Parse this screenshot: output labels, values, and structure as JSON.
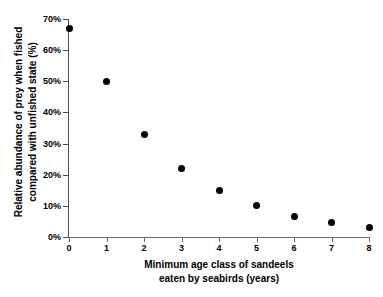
{
  "clipped_header_text": "",
  "chart_data": {
    "type": "scatter",
    "title": "",
    "xlabel_lines": [
      "Minimum age class of sandeels",
      "eaten by seabirds (years)"
    ],
    "ylabel_lines": [
      "Relative abundance of prey when fished",
      "compared with unfished state (%)"
    ],
    "x": [
      0,
      1,
      2,
      3,
      4,
      5,
      6,
      7,
      8
    ],
    "values": [
      67,
      50,
      33,
      22,
      15,
      10,
      6.5,
      4.5,
      3
    ],
    "x_tick_labels": [
      "0",
      "1",
      "2",
      "3",
      "4",
      "5",
      "6",
      "7",
      "8"
    ],
    "y_tick_labels": [
      "0%",
      "10%",
      "20%",
      "30%",
      "40%",
      "50%",
      "60%",
      "70%"
    ],
    "y_tick_values": [
      0,
      10,
      20,
      30,
      40,
      50,
      60,
      70
    ],
    "xlim": [
      0,
      8
    ],
    "ylim": [
      0,
      70
    ],
    "grid": false,
    "legend": false,
    "marker": "filled-circle",
    "marker_color": "#000000",
    "axis_color": "#4d4d4d"
  }
}
